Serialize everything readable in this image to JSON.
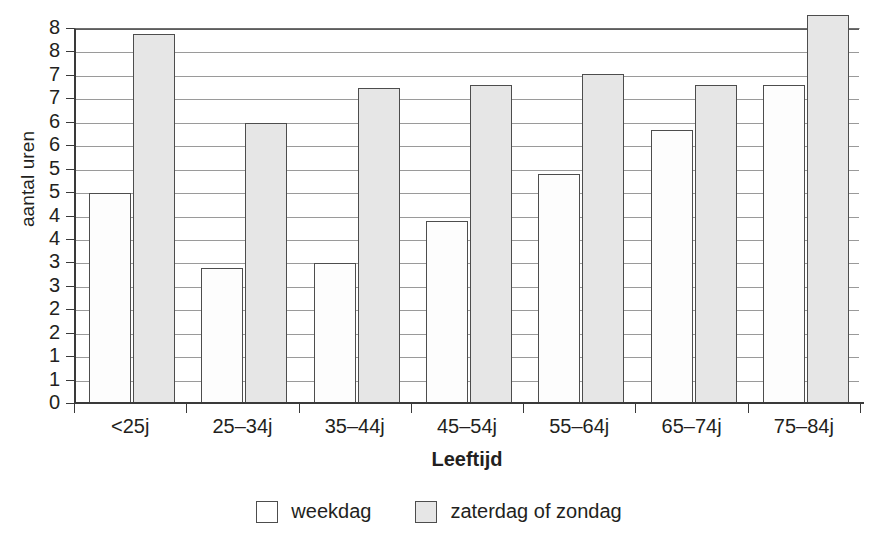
{
  "chart_data": {
    "type": "bar",
    "title": "",
    "xlabel": "Leeftijd",
    "ylabel": "aantal uren",
    "categories": [
      "<25j",
      "25–34j",
      "35–44j",
      "45–54j",
      "55–64j",
      "65–74j",
      "75–84j"
    ],
    "series": [
      {
        "name": "weekdag",
        "color": "#ffffff",
        "values": [
          4.5,
          2.9,
          3.0,
          3.9,
          4.9,
          5.85,
          6.8
        ]
      },
      {
        "name": "zaterdag of zondag",
        "color": "#e6e6e6",
        "values": [
          7.9,
          6.0,
          6.75,
          6.8,
          7.05,
          6.8,
          8.3
        ]
      }
    ],
    "ylim": [
      0,
      8
    ],
    "ytick_labels": [
      "8",
      "8",
      "7",
      "7",
      "6",
      "6",
      "5",
      "5",
      "4",
      "4",
      "3",
      "3",
      "2",
      "2",
      "1",
      "1",
      "0"
    ],
    "ytick_values": [
      8,
      7.5,
      7,
      6.5,
      6,
      5.5,
      5,
      4.5,
      4,
      3.5,
      3,
      2.5,
      2,
      1.5,
      1,
      0.5,
      0
    ],
    "grid": true,
    "legend_position": "bottom-center"
  },
  "axes": {
    "y_title": "aantal uren",
    "x_title": "Leeftijd"
  },
  "legend": {
    "items": [
      {
        "label": "weekdag",
        "swatch": "weekdag"
      },
      {
        "label": "zaterdag of zondag",
        "swatch": "weekend"
      }
    ]
  }
}
